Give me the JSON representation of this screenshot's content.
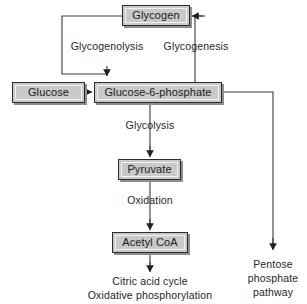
{
  "diagram": {
    "background_color": "#ffffff",
    "node_fill_color": "#c9c9c9",
    "node_border_color": "#2b2b2b",
    "line_color": "#3a3a3a",
    "text_color": "#262626",
    "nodes": [
      {
        "id": "glycogen",
        "label": "Glycogen"
      },
      {
        "id": "glucose",
        "label": "Glucose"
      },
      {
        "id": "g6p",
        "label": "Glucose-6-phosphate"
      },
      {
        "id": "pyruvate",
        "label": "Pyruvate"
      },
      {
        "id": "acetyl_coa",
        "label": "Acetyl CoA"
      }
    ],
    "edge_labels": [
      {
        "id": "glycogenolysis",
        "label": "Glycogenolysis"
      },
      {
        "id": "glycogenesis",
        "label": "Glycogenesis"
      },
      {
        "id": "glycolysis",
        "label": "Glycolysis"
      },
      {
        "id": "oxidation",
        "label": "Oxidation"
      }
    ],
    "terminals": [
      {
        "id": "citric_acid_outcome",
        "lines": [
          "Citric acid cycle",
          "Oxidative phosphorylation"
        ]
      },
      {
        "id": "pentose_phosphate_pathway",
        "lines": [
          "Pentose",
          "phosphate",
          "pathway"
        ]
      }
    ]
  }
}
